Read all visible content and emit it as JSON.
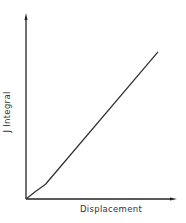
{
  "chart_data": {
    "type": "line",
    "title": "",
    "xlabel": "Displacement",
    "ylabel": "J Integral",
    "grid": false,
    "legend": null,
    "axis_ticks": false,
    "xlim": [
      0,
      1
    ],
    "ylim": [
      0,
      1
    ],
    "series": [
      {
        "name": "J Integral vs Displacement",
        "x": [
          0.0,
          0.06,
          0.13,
          0.88
        ],
        "y": [
          0.0,
          0.04,
          0.08,
          0.8
        ]
      }
    ],
    "annotations": []
  },
  "colors": {
    "axis": "#222222",
    "line": "#333333",
    "text": "#333333"
  }
}
